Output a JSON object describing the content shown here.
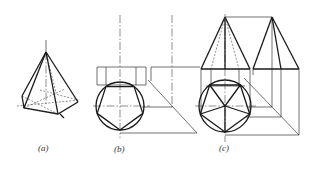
{
  "figure": {
    "panels": [
      {
        "id": "a",
        "label": "(a)",
        "description": "Pentagonal pyramid, pictorial view"
      },
      {
        "id": "b",
        "label": "(b)",
        "description": "Base projections: top view pentagon inscribed in circle, front and side base prisms with 45° miter line"
      },
      {
        "id": "c",
        "label": "(c)",
        "description": "Complete three-view drawing of pentagonal pyramid with front, side and top views"
      }
    ]
  },
  "colors": {
    "line": "#1a1a1a",
    "background": "#ffffff"
  }
}
